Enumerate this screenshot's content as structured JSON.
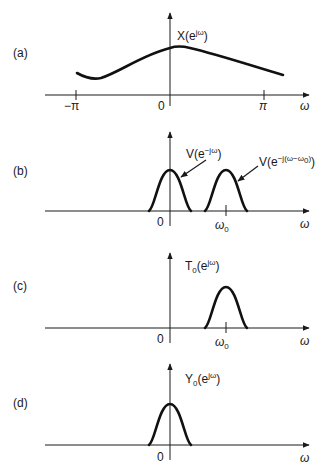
{
  "panels": [
    {
      "id": "a",
      "panel_label": "(a)",
      "function_label": "X(e",
      "function_label_sup": "jω",
      "function_label_close": ")",
      "x_axis_label": "ω",
      "ticks": [
        {
          "label": "−π",
          "value": "-pi"
        },
        {
          "label": "0",
          "value": "0"
        },
        {
          "label": "π",
          "value": "pi"
        }
      ]
    },
    {
      "id": "b",
      "panel_label": "(b)",
      "function_label": "V(e",
      "function_label_sup": "−jω",
      "function_label_close": ")",
      "shifted_label": "V(e",
      "shifted_label_sup": "−j(ω−ω",
      "shifted_label_sup_sub": "0",
      "shifted_label_close": ")",
      "x_axis_label": "ω",
      "ticks": [
        {
          "label": "0",
          "value": "0"
        },
        {
          "label": "ω",
          "sub": "0",
          "value": "omega_0"
        }
      ]
    },
    {
      "id": "c",
      "panel_label": "(c)",
      "function_label": "T",
      "function_label_sub": "0",
      "function_label_mid": "(e",
      "function_label_sup": "jω",
      "function_label_close": ")",
      "x_axis_label": "ω",
      "ticks": [
        {
          "label": "0",
          "value": "0"
        },
        {
          "label": "ω",
          "sub": "0",
          "value": "omega_0"
        }
      ]
    },
    {
      "id": "d",
      "panel_label": "(d)",
      "function_label": "Y",
      "function_label_sub": "0",
      "function_label_mid": "(e",
      "function_label_sup": "jω",
      "function_label_close": ")",
      "x_axis_label": "ω",
      "ticks": [
        {
          "label": "0",
          "value": "0"
        }
      ]
    }
  ]
}
